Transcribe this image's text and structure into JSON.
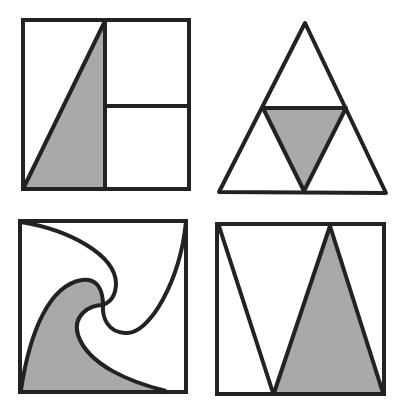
{
  "diagram": {
    "colors": {
      "stroke": "#222222",
      "shade": "#a9a9a9",
      "background": "#ffffff"
    },
    "figures": [
      {
        "id": "square-divided-triangle",
        "position": "top-left",
        "shape": "square",
        "shaded_region": "right triangle in left half"
      },
      {
        "id": "triangle-inner-inverted",
        "position": "top-right",
        "shape": "triangle",
        "shaded_region": "inverted inner triangle (midpoints)"
      },
      {
        "id": "square-swirl",
        "position": "bottom-left",
        "shape": "square",
        "shaded_region": "curved pinwheel segment at bottom-left"
      },
      {
        "id": "square-triangles",
        "position": "bottom-right",
        "shape": "square",
        "shaded_region": "tall triangle on right"
      }
    ]
  }
}
